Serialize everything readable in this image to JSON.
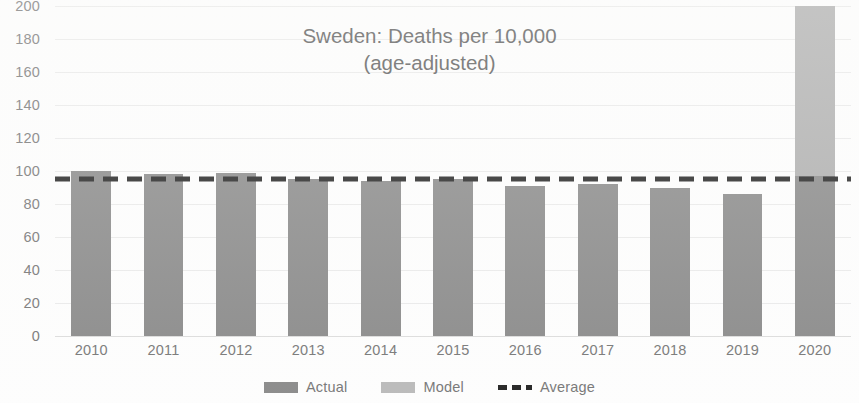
{
  "chart_data": {
    "type": "bar",
    "title": "Sweden: Deaths per 10,000",
    "subtitle": "(age-adjusted)",
    "xlabel": "",
    "ylabel": "",
    "ylim": [
      0,
      200
    ],
    "ytick_step": 20,
    "grid": true,
    "legend_position": "bottom",
    "categories": [
      "2010",
      "2011",
      "2012",
      "2013",
      "2014",
      "2015",
      "2016",
      "2017",
      "2018",
      "2019",
      "2020"
    ],
    "series": [
      {
        "name": "Actual",
        "color": "#808080",
        "values": [
          100,
          98,
          99,
          95,
          94,
          95,
          91,
          92,
          90,
          86,
          97
        ]
      },
      {
        "name": "Model",
        "color": "#a8a8a8",
        "values": [
          null,
          null,
          null,
          null,
          null,
          null,
          null,
          null,
          null,
          null,
          204
        ]
      }
    ],
    "reference_line": {
      "name": "Average",
      "value": 95,
      "style": "dashed",
      "color": "#111111"
    },
    "ytick_labels": [
      "200",
      "180",
      "160",
      "140",
      "120",
      "100",
      "80",
      "60",
      "40",
      "20",
      "0"
    ],
    "ytick_values": [
      200,
      180,
      160,
      140,
      120,
      100,
      80,
      60,
      40,
      20,
      0
    ]
  },
  "legend": {
    "items": [
      {
        "label": "Actual",
        "marker": "filled-square-dark"
      },
      {
        "label": "Model",
        "marker": "filled-square-light"
      },
      {
        "label": "Average",
        "marker": "dashed-line"
      }
    ]
  },
  "colors": {
    "actual": "#808080",
    "model": "#a8a8a8",
    "average": "#111111",
    "axis_text": "#6b6b6b",
    "title_text": "#4a4a4a",
    "gridline": "#e8e8e8",
    "background": "#fdfdfd"
  }
}
